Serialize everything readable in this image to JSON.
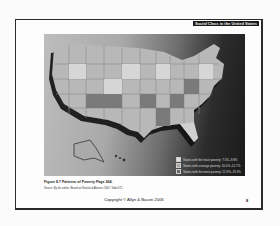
{
  "slide": {
    "header_title": "Social Class in the United States",
    "figure_caption": "Figure 8.7  Patterns of Poverty   Page 264.",
    "source_note": "Source: By the author. Based on Statistical Abstract 2002: Table 671.",
    "copyright": "Copyright © Allyn & Bacon 2006",
    "page_number": "8"
  },
  "map": {
    "title": "Patterns of Poverty (US states)",
    "legend": [
      {
        "label": "States with the least poverty: 7.5%–9.8%",
        "color": "#e0e0e0"
      },
      {
        "label": "States with average poverty: 10.0%–12.7%",
        "color": "#a8a8a8"
      },
      {
        "label": "States with the most poverty: 12.9%–19.3%",
        "color": "#6a6a6a"
      }
    ]
  }
}
